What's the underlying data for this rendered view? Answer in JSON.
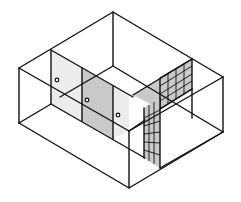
{
  "figure": {
    "type": "isometric-wireframe",
    "colors": {
      "line": "#111111",
      "shaded_panel": "#c9c9c9",
      "light_panel": "#ececec",
      "background": "#ffffff"
    },
    "elements": {
      "doors": 3,
      "door_knobs": 3,
      "grid_walls": [
        {
          "name": "back-right-grid",
          "rows": 4,
          "cols": 4
        },
        {
          "name": "front-vertical-grid",
          "rows": 6,
          "cols": 3
        }
      ]
    }
  }
}
